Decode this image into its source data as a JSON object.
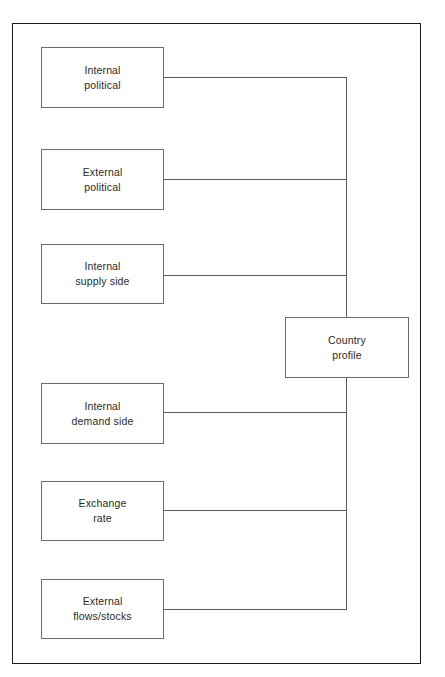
{
  "diagram": {
    "type": "flowchart",
    "orientation": "left-to-right convergence",
    "frame": {
      "border_color": "#1c1c1c",
      "background": "#ffffff"
    },
    "style": {
      "node_border_color": "#6b6b6b",
      "connector_color": "#5a5a5a",
      "text_color": "#2a2a2a"
    },
    "hub": {
      "id": "country-profile",
      "label": "Country\nprofile",
      "x": 284,
      "y": 316,
      "width": 124,
      "height": 61
    },
    "inputs": [
      {
        "id": "internal-political",
        "label": "Internal\npolitical",
        "x": 40,
        "y": 46,
        "width": 123,
        "height": 61,
        "connector_y": 76
      },
      {
        "id": "external-political",
        "label": "External\npolitical",
        "x": 40,
        "y": 148,
        "width": 123,
        "height": 61,
        "connector_y": 178
      },
      {
        "id": "internal-supply-side",
        "label": "Internal\nsupply side",
        "x": 40,
        "y": 243,
        "width": 123,
        "height": 60,
        "connector_y": 274
      },
      {
        "id": "internal-demand-side",
        "label": "Internal\ndemand  side",
        "x": 40,
        "y": 382,
        "width": 123,
        "height": 61,
        "connector_y": 411
      },
      {
        "id": "exchange-rate",
        "label": "Exchange\nrate",
        "x": 40,
        "y": 480,
        "width": 123,
        "height": 60,
        "connector_y": 509
      },
      {
        "id": "external-flows-stocks",
        "label": "External\nflows/stocks",
        "x": 40,
        "y": 578,
        "width": 123,
        "height": 60,
        "connector_y": 608
      }
    ],
    "trunk": {
      "x": 345,
      "top_y": 76,
      "bottom_y": 608
    }
  }
}
